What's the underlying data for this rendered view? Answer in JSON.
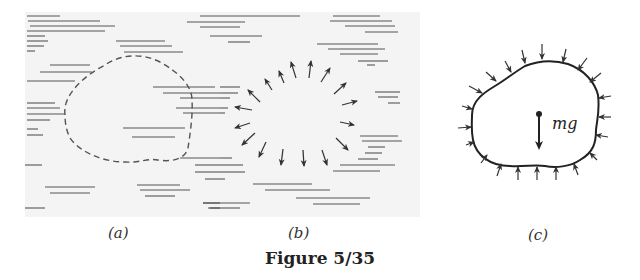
{
  "figure": {
    "caption": "Figure 5/35",
    "panels": [
      {
        "id": "a",
        "label": "(a)",
        "description": "Fluid region with dashed outline of an arbitrary element"
      },
      {
        "id": "b",
        "label": "(b)",
        "description": "Element removed; surrounding fluid pressure arrows pointing outward from cavity"
      },
      {
        "id": "c",
        "label": "(c)",
        "description": "Free-body diagram of element with inward pressure arrows and weight"
      }
    ],
    "weight_label": "mg"
  },
  "colors": {
    "ink": "#333333",
    "background": "#ffffff",
    "fluid_shading": "#f2f2f2"
  }
}
